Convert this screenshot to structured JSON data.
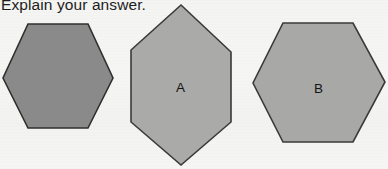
{
  "page": {
    "prompt_text": "Explain your answer.",
    "background_color": "#f4f4f2",
    "width": 388,
    "height": 169
  },
  "shapes": [
    {
      "id": "hexagon-unlabeled",
      "label": "",
      "type": "hexagon",
      "orientation": "flat-top",
      "fill_color": "#8a8a8a",
      "stroke_color": "#30302f",
      "bbox": {
        "x": 2,
        "y": 24,
        "width": 111,
        "height": 103
      }
    },
    {
      "id": "hexagon-a",
      "label": "A",
      "type": "hexagon",
      "orientation": "pointy-top",
      "fill_color": "#aaaaa8",
      "stroke_color": "#3a3a39",
      "bbox": {
        "x": 131,
        "y": 5,
        "width": 100,
        "height": 160
      }
    },
    {
      "id": "hexagon-b",
      "label": "B",
      "type": "hexagon",
      "orientation": "flat-top",
      "fill_color": "#a8a8a6",
      "stroke_color": "#3a3a39",
      "bbox": {
        "x": 253,
        "y": 23,
        "width": 132,
        "height": 119
      }
    }
  ],
  "labels": {
    "a": "A",
    "b": "B"
  }
}
